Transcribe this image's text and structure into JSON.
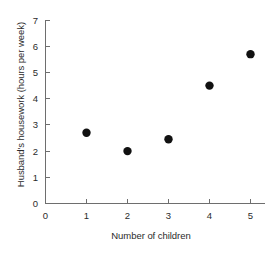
{
  "chart_data": {
    "type": "scatter",
    "title": "",
    "xlabel": "Number of children",
    "ylabel": "Husband's housework (hours per week)",
    "xlim": [
      0,
      5.35
    ],
    "ylim": [
      0,
      7
    ],
    "xticks": [
      0,
      1,
      2,
      3,
      4,
      5
    ],
    "xticklabels": [
      "0",
      "1",
      "2",
      "3",
      "4",
      "5"
    ],
    "yticks": [
      0,
      1,
      2,
      3,
      4,
      5,
      6,
      7
    ],
    "yticklabels": [
      "0",
      "1",
      "2",
      "3",
      "4",
      "5",
      "6",
      "7"
    ],
    "grid": false,
    "legend": false,
    "marker": "filled-circle",
    "marker_color": "#111111",
    "marker_size": 4.2,
    "axis_color": "#6e6e6e",
    "background_color": "#ffffff",
    "x": [
      1,
      2,
      3,
      4,
      5
    ],
    "y": [
      2.7,
      2.0,
      2.45,
      4.5,
      5.7
    ],
    "points": [
      {
        "x": 1,
        "y": 2.7
      },
      {
        "x": 2,
        "y": 2.0
      },
      {
        "x": 3,
        "y": 2.45
      },
      {
        "x": 4,
        "y": 4.5
      },
      {
        "x": 5,
        "y": 5.7
      }
    ]
  }
}
